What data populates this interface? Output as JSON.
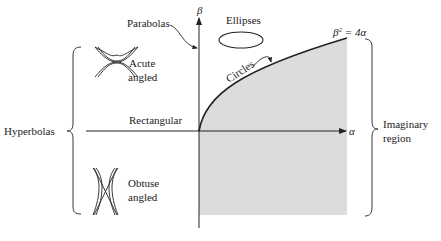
{
  "diagram": {
    "axes": {
      "x_label": "α",
      "y_label": "β"
    },
    "curve": {
      "equation_lhs": "β",
      "equation_exp": "2",
      "equation_rhs": " = 4α",
      "label_circles": "Circles"
    },
    "labels": {
      "parabolas": "Parabolas",
      "ellipses": "Ellipses",
      "rectangular": "Rectangular",
      "hyperbolas": "Hyperbolas",
      "acute_line1": "Acute",
      "acute_line2": "angled",
      "obtuse_line1": "Obtuse",
      "obtuse_line2": "angled",
      "imaginary_line1": "Imaginary",
      "imaginary_line2": "region"
    },
    "colors": {
      "shade": "#dcdcdc",
      "ink": "#222222"
    }
  }
}
